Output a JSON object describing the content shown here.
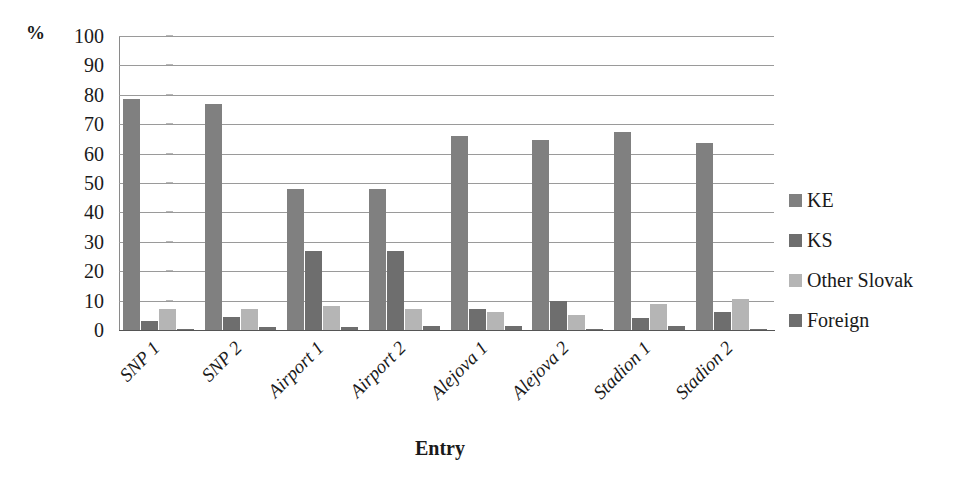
{
  "chart_data": {
    "type": "bar",
    "title": "",
    "subtitle": "",
    "xlabel": "Entry",
    "ylabel": "%",
    "unit_label": "%",
    "ylim": [
      0,
      100
    ],
    "ytick_step": 10,
    "yticks": [
      100,
      90,
      80,
      70,
      60,
      50,
      40,
      30,
      20,
      10,
      0
    ],
    "grid": true,
    "grid_axis": "y",
    "legend_position": "right",
    "categories": [
      "SNP 1",
      "SNP 2",
      "Airport 1",
      "Airport 2",
      "Alejova 1",
      "Alejova 2",
      "Stadion 1",
      "Stadion 2"
    ],
    "series": [
      {
        "name": "KE",
        "color": "#808080",
        "values": [
          78.5,
          77.0,
          48.0,
          48.0,
          66.0,
          64.5,
          67.5,
          63.5
        ]
      },
      {
        "name": "KS",
        "color": "#6e6e6e",
        "values": [
          3.0,
          4.5,
          27.0,
          27.0,
          7.0,
          10.0,
          4.0,
          6.0
        ]
      },
      {
        "name": "Other Slovak",
        "color": "#b5b5b5",
        "values": [
          7.0,
          7.0,
          8.0,
          7.0,
          6.0,
          5.0,
          9.0,
          10.5
        ]
      },
      {
        "name": "Foreign",
        "color": "#6e6e6e",
        "values": [
          0.5,
          1.0,
          1.0,
          1.5,
          1.5,
          0.5,
          1.5,
          0.5
        ]
      }
    ]
  },
  "axis": {
    "y_unit": "%",
    "x_title": "Entry"
  },
  "legend": {
    "entries": [
      {
        "label": "KE",
        "color": "#808080"
      },
      {
        "label": "KS",
        "color": "#6e6e6e"
      },
      {
        "label": "Other Slovak",
        "color": "#b5b5b5"
      },
      {
        "label": "Foreign",
        "color": "#6e6e6e"
      }
    ]
  },
  "colors": {
    "gridline": "#9a9a9a",
    "axis": "#555555",
    "text": "#1a1a1a",
    "background": "#ffffff"
  }
}
